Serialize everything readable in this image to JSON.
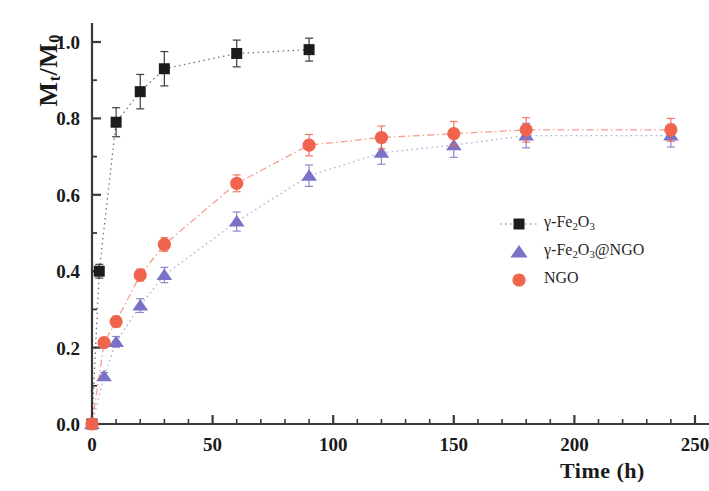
{
  "chart_data": {
    "type": "scatter",
    "title": "",
    "xlabel": "Time (h)",
    "ylabel": "Mt/M0",
    "ylabel_parts": {
      "prefix": "M",
      "sub1": "t",
      "mid": "/M",
      "sub2": "0"
    },
    "xlim": [
      0,
      250
    ],
    "ylim": [
      0.0,
      1.05
    ],
    "grid": false,
    "x_ticks": [
      0,
      50,
      100,
      150,
      200,
      250
    ],
    "x_tick_labels": [
      "0",
      "50",
      "100",
      "150",
      "200",
      "250"
    ],
    "x_minor_interval": 10,
    "y_ticks": [
      0.0,
      0.2,
      0.4,
      0.6,
      0.8,
      1.0
    ],
    "y_tick_labels": [
      "0.0",
      "0.2",
      "0.4",
      "0.6",
      "0.8",
      "1.0"
    ],
    "y_minor_interval": 0.1,
    "legend_position": "center-right",
    "series": [
      {
        "name": "γ-Fe2O3",
        "marker": "square",
        "color": "#1c1c1c",
        "line_style": "dotted",
        "x": [
          0,
          3,
          10,
          20,
          30,
          60,
          90
        ],
        "y": [
          0.0,
          0.4,
          0.79,
          0.87,
          0.93,
          0.97,
          0.98
        ],
        "yerr": [
          0.0,
          0.018,
          0.038,
          0.045,
          0.045,
          0.035,
          0.03
        ]
      },
      {
        "name": "γ-Fe2O3@NGO",
        "marker": "triangle",
        "color": "#7a72c6",
        "line_style": "dotted",
        "x": [
          0,
          5,
          10,
          20,
          30,
          60,
          90,
          120,
          150,
          180,
          240
        ],
        "y": [
          0.0,
          0.125,
          0.215,
          0.31,
          0.39,
          0.53,
          0.65,
          0.71,
          0.73,
          0.755,
          0.755
        ],
        "yerr": [
          0.0,
          0.01,
          0.014,
          0.018,
          0.02,
          0.025,
          0.028,
          0.03,
          0.032,
          0.032,
          0.03
        ]
      },
      {
        "name": "NGO",
        "marker": "circle",
        "color": "#f0634c",
        "line_style": "dashdot",
        "x": [
          0,
          5,
          10,
          20,
          30,
          60,
          90,
          120,
          150,
          180,
          240
        ],
        "y": [
          0.0,
          0.213,
          0.268,
          0.39,
          0.47,
          0.63,
          0.73,
          0.75,
          0.76,
          0.77,
          0.77
        ],
        "yerr": [
          0.0,
          0.012,
          0.014,
          0.016,
          0.018,
          0.022,
          0.028,
          0.03,
          0.032,
          0.032,
          0.03
        ]
      }
    ]
  },
  "legend": {
    "entries": [
      {
        "label_html": "γ-Fe<sub>2</sub>O<sub>3</sub>",
        "marker": "square",
        "color": "#1c1c1c",
        "show_line": true
      },
      {
        "label_html": "γ-Fe<sub>2</sub>O<sub>3</sub>@NGO",
        "marker": "triangle",
        "color": "#7a72c6",
        "show_line": false
      },
      {
        "label_html": "NGO",
        "marker": "circle",
        "color": "#f0634c",
        "show_line": false
      }
    ]
  },
  "colors": {
    "axis": "#3a3a3a",
    "series_black": "#1c1c1c",
    "series_purple": "#7a72c6",
    "series_coral": "#f0634c",
    "background": "#ffffff"
  }
}
